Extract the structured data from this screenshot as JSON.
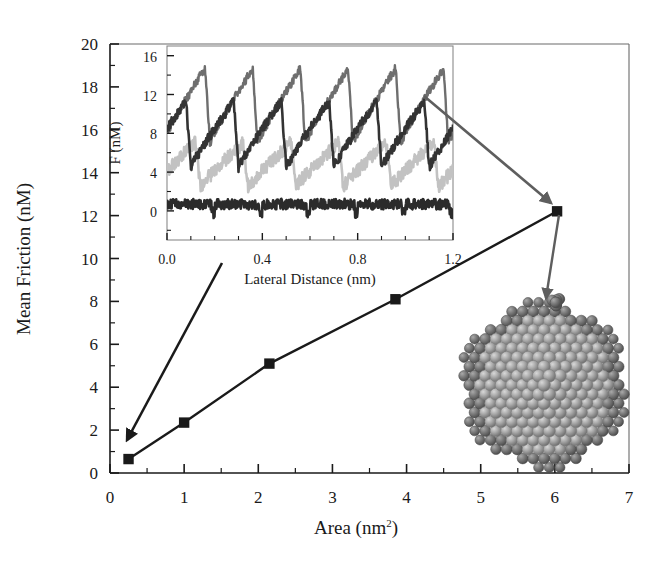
{
  "chart_data": [
    {
      "type": "line",
      "id": "main",
      "title": "",
      "xlabel": "Area (nm2)",
      "xlabel_base": "Area (nm",
      "xlabel_sup": "2",
      "xlabel_tail": ")",
      "ylabel": "Mean Friction (nM)",
      "xlim": [
        0,
        7
      ],
      "ylim": [
        0,
        20
      ],
      "xticks": [
        0,
        1,
        2,
        3,
        4,
        5,
        6,
        7
      ],
      "yticks": [
        0,
        2,
        4,
        6,
        8,
        10,
        12,
        14,
        16,
        18,
        20
      ],
      "xtick_labels": [
        "0",
        "1",
        "2",
        "3",
        "4",
        "5",
        "6",
        "7"
      ],
      "ytick_labels": [
        "0",
        "2",
        "4",
        "6",
        "8",
        "10",
        "12",
        "14",
        "16",
        "18",
        "20"
      ],
      "minor_tick_step_x": 0.5,
      "minor_tick_step_y": 1,
      "grid": false,
      "legend": "none",
      "marker": "filled-square",
      "line_color": "#1a1a1a",
      "x": [
        0.25,
        1.0,
        2.15,
        3.85,
        6.03
      ],
      "y": [
        0.65,
        2.35,
        5.1,
        8.1,
        12.2
      ],
      "points": [
        {
          "x": 0.25,
          "y": 0.65
        },
        {
          "x": 1.0,
          "y": 2.35
        },
        {
          "x": 2.15,
          "y": 5.1
        },
        {
          "x": 3.85,
          "y": 8.1
        },
        {
          "x": 6.03,
          "y": 12.2
        }
      ]
    },
    {
      "type": "line",
      "id": "inset",
      "title": "",
      "xlabel": "Lateral Distance (nm)",
      "ylabel": "F (nM)",
      "xlim": [
        0,
        1.2
      ],
      "ylim": [
        -3,
        17
      ],
      "xticks": [
        0.0,
        0.4,
        0.8,
        1.2
      ],
      "yticks": [
        0,
        4,
        8,
        12,
        16
      ],
      "xtick_labels": [
        "0.0",
        "0.4",
        "0.8",
        "1.2"
      ],
      "ytick_labels": [
        "0",
        "4",
        "8",
        "12",
        "16"
      ],
      "minor_tick_step_x": 0.1,
      "minor_tick_step_y": 2,
      "grid": false,
      "legend": "none",
      "series": [
        {
          "name": "trace-top",
          "color": "#6e6e6e",
          "baseline": 7.0,
          "amplitude": 8.5,
          "period": 0.2,
          "phase": 0.02,
          "noise": 0.45
        },
        {
          "name": "trace-upper-mid",
          "color": "#333333",
          "baseline": 4.5,
          "amplitude": 7.5,
          "period": 0.2,
          "phase": 0.1,
          "noise": 0.5
        },
        {
          "name": "trace-lower-mid",
          "color": "#c2c2c2",
          "baseline": 2.5,
          "amplitude": 5.0,
          "period": 0.2,
          "phase": 0.06,
          "noise": 0.7
        },
        {
          "name": "trace-bottom",
          "color": "#2b2b2b",
          "baseline": 0.7,
          "amplitude": 0.9,
          "period": 0.2,
          "phase": 0.0,
          "noise": 0.55
        }
      ]
    }
  ],
  "annotations": {
    "arrow_inset_to_point": {
      "name": "arrow-inset-to-last-point",
      "color": "#5e5e5e"
    },
    "arrow_point_to_particle": {
      "name": "arrow-point-to-nanoparticle",
      "color": "#5e5e5e"
    },
    "arrow_inset_to_first_point": {
      "name": "arrow-inset-to-first-point",
      "color": "#1a1a1a"
    }
  },
  "nanoparticle": {
    "name": "gold-nanoparticle-render",
    "description": "truncated-octahedron cluster of spheres",
    "sphere_color": "#a8a8a8",
    "edge_color": "#6b6b6b",
    "highlight_color": "#c9c9c9"
  },
  "colors": {
    "axis": "#1a1a1a",
    "background": "#ffffff",
    "annotation_arrow": "#5e5e5e"
  }
}
